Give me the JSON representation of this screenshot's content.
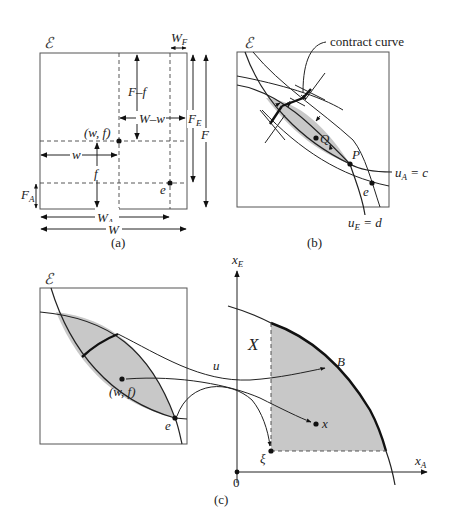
{
  "panel_a": {
    "caption": "(a)",
    "box_label": "ℰ",
    "labels": {
      "W_F": "W",
      "W_F_sub": "F",
      "F_minus_f": "F–f",
      "W_minus_w": "W–w",
      "F_E": "F",
      "F_E_sub": "E",
      "F": "F",
      "point_wf": "(w, f)",
      "w": "w",
      "f": "f",
      "F_A": "F",
      "F_A_sub": "A",
      "e": "e",
      "W_A": "W",
      "W_A_sub": "A",
      "W": "W"
    }
  },
  "panel_b": {
    "caption": "(b)",
    "box_label": "ℰ",
    "labels": {
      "contract_curve": "contract curve",
      "Q": "Q",
      "P": "P",
      "e": "e",
      "uA": "u",
      "uA_sub": "A",
      "uA_eq": " = c",
      "uE": "u",
      "uE_sub": "E",
      "uE_eq": " = d"
    }
  },
  "panel_c": {
    "caption": "(c)",
    "box_label": "ℰ",
    "labels": {
      "point_wf": "(w, f)",
      "e": "e",
      "u": "u",
      "X": "X",
      "B": "B",
      "x": "x",
      "xi": "ξ",
      "origin": "0",
      "xE": "x",
      "xE_sub": "E",
      "xA": "x",
      "xA_sub": "A"
    }
  }
}
